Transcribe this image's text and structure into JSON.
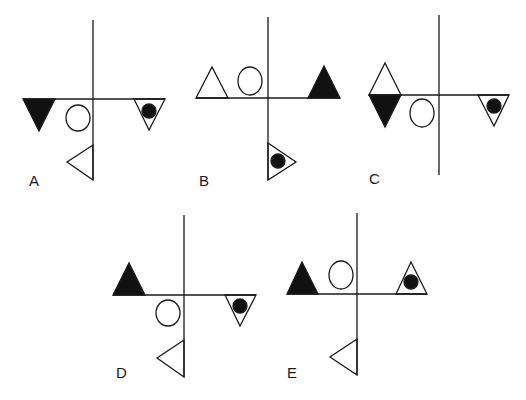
{
  "puzzle": {
    "stroke_color": "#1a1a1a",
    "fill_color": "#111111",
    "options": [
      {
        "label": "A",
        "description": "Filled down-triangle left on axis, circle lower-left near axis, outline down-triangle with black dot right, left-pointing outline triangle below on vertical axis"
      },
      {
        "label": "B",
        "description": "Outline up-triangle and circle above axis on left, filled up-triangle on right, right-pointing triangle with dot below on vertical axis"
      },
      {
        "label": "C",
        "description": "Outline up-triangle atop filled down-triangle on left, circle lower-left near axis, outline down-triangle with dot on right"
      },
      {
        "label": "D",
        "description": "Filled up-triangle left, circle below axis near center, outline down-triangle with dot right, left-pointing outline triangle below"
      },
      {
        "label": "E",
        "description": "Filled up-triangle left, circle above axis near center, outline up-triangle with dot right, left-pointing outline triangle below"
      }
    ]
  }
}
